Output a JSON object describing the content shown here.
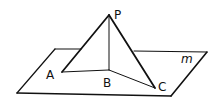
{
  "diagram": {
    "type": "geometry-3d",
    "colors": {
      "stroke": "#111111",
      "background": "#ffffff"
    },
    "plane": {
      "label": "m",
      "corners": [
        [
          55,
          49
        ],
        [
          207,
          52
        ],
        [
          171,
          96
        ],
        [
          17,
          93
        ]
      ]
    },
    "points": {
      "P": {
        "label": "P",
        "x": 109,
        "y": 15
      },
      "A": {
        "label": "A",
        "x": 62,
        "y": 72
      },
      "B": {
        "label": "B",
        "x": 109,
        "y": 70
      },
      "C": {
        "label": "C",
        "x": 155,
        "y": 88
      }
    },
    "segments": [
      {
        "from": "P",
        "to": "A",
        "weight": "thick"
      },
      {
        "from": "P",
        "to": "C",
        "weight": "thick"
      },
      {
        "from": "P",
        "to": "B",
        "weight": "thin"
      },
      {
        "from": "A",
        "to": "B",
        "weight": "thin"
      },
      {
        "from": "B",
        "to": "C",
        "weight": "thin"
      }
    ]
  }
}
